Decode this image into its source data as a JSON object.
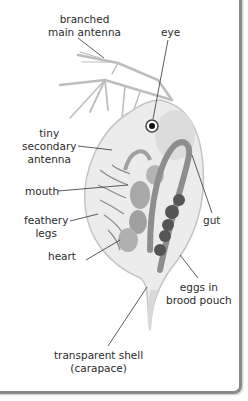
{
  "diagram": {
    "labels": {
      "main_antenna": [
        "branched",
        "main antenna"
      ],
      "eye": "eye",
      "secondary_antenna": [
        "tiny",
        "secondary",
        "antenna"
      ],
      "mouth": "mouth",
      "legs": [
        "feathery",
        "legs"
      ],
      "heart": "heart",
      "gut": "gut",
      "eggs": [
        "eggs in",
        "brood pouch"
      ],
      "shell": [
        "transparent shell",
        "(carapace)"
      ]
    },
    "colors": {
      "frame_border": "#8a8a8a",
      "label_text": "#2b2b2b",
      "leader_line": "#333333",
      "body_light": "#e4e4e4",
      "body_mid": "#b8b8b8",
      "gut": "#8e8e8e",
      "eggs": "#555555"
    }
  }
}
